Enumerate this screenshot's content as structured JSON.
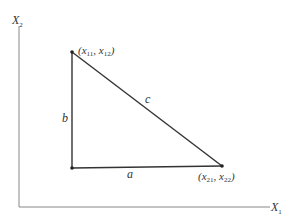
{
  "diagram": {
    "axes": {
      "x_label": "X",
      "x_label_sub": "1",
      "y_label": "X",
      "y_label_sub": "2"
    },
    "vertices": {
      "top": {
        "label": "(x",
        "sub1": "11",
        "sep": ", x",
        "sub2": "12",
        "close": ")"
      },
      "bottom_right": {
        "label": "(x",
        "sub1": "21",
        "sep": ", x",
        "sub2": "22",
        "close": ")"
      }
    },
    "sides": {
      "a": "a",
      "b": "b",
      "c": "c"
    },
    "colors": {
      "axis": "#888888",
      "triangle": "#333333",
      "text": "#333333"
    }
  }
}
